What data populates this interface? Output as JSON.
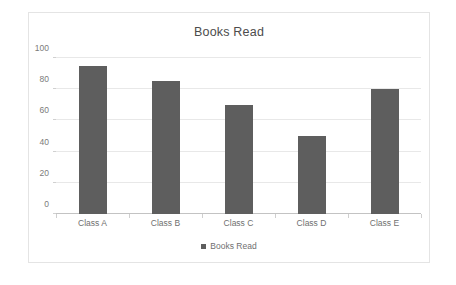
{
  "chart_data": {
    "type": "bar",
    "title": "Books Read",
    "categories": [
      "Class A",
      "Class B",
      "Class C",
      "Class D",
      "Class E"
    ],
    "values": [
      95,
      85,
      70,
      50,
      80
    ],
    "series": [
      {
        "name": "Books Read",
        "values": [
          95,
          85,
          70,
          50,
          80
        ]
      }
    ],
    "xlabel": "",
    "ylabel": "",
    "ylim": [
      0,
      100
    ],
    "ytick_labels": [
      "0",
      "20",
      "40",
      "60",
      "80",
      "100"
    ],
    "ytick_values": [
      0,
      20,
      40,
      60,
      80,
      100
    ],
    "grid": true,
    "legend": {
      "position": "bottom",
      "entries": [
        "Books Read"
      ]
    },
    "colors": {
      "bar": "#5e5e5e",
      "gridline": "#e8e8e8",
      "axis": "#c3c3c3",
      "text": "#6f6f6f",
      "title_text": "#4c4c4c",
      "frame_border": "#e4e4e4",
      "background": "#ffffff"
    }
  }
}
